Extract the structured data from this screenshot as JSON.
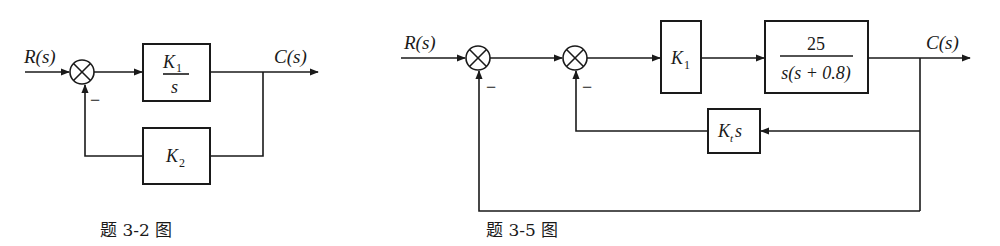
{
  "diagrams": [
    {
      "caption": "题 3-2 图",
      "input_label": "R(s)",
      "output_label": "C(s)",
      "forward_block": {
        "numerator": "K",
        "numerator_sub": "1",
        "denominator": "s"
      },
      "feedback_block": {
        "label": "K",
        "label_sub": "2"
      },
      "summing_junctions": [
        {
          "feedback_sign": "−"
        }
      ]
    },
    {
      "caption": "题 3-5 图",
      "input_label": "R(s)",
      "output_label": "C(s)",
      "gain_block": {
        "label": "K",
        "label_sub": "1"
      },
      "plant_block": {
        "numerator": "25",
        "denominator": "s(s + 0.8)"
      },
      "rate_feedback_block": {
        "label": "K",
        "label_sub": "t",
        "suffix": "s"
      },
      "summing_junctions": [
        {
          "feedback_sign": "−"
        },
        {
          "feedback_sign": "−"
        }
      ]
    }
  ]
}
